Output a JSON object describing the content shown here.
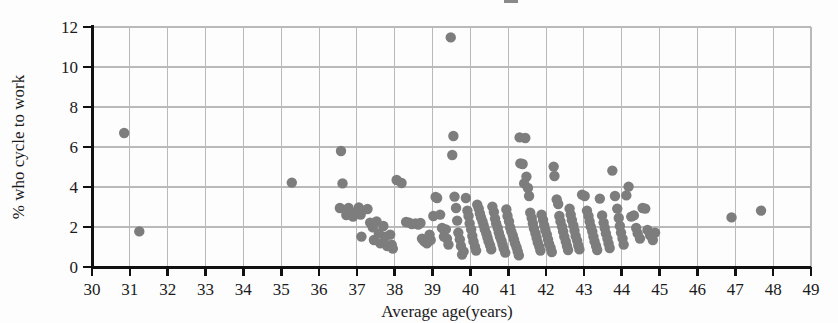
{
  "chart_data": {
    "type": "scatter",
    "title": "",
    "xlabel": "Average age(years)",
    "ylabel": "% who cycle to work",
    "xlim": [
      30,
      49
    ],
    "ylim": [
      0,
      12
    ],
    "xticks": [
      30,
      31,
      32,
      33,
      34,
      35,
      36,
      37,
      38,
      39,
      40,
      41,
      42,
      43,
      44,
      45,
      46,
      47,
      48,
      49
    ],
    "yticks": [
      0,
      2,
      4,
      6,
      8,
      10,
      12
    ],
    "xtick_labels": [
      "30",
      "31",
      "32",
      "33",
      "34",
      "35",
      "36",
      "37",
      "38",
      "39",
      "40",
      "41",
      "42",
      "43",
      "44",
      "45",
      "46",
      "47",
      "48",
      "49"
    ],
    "ytick_labels": [
      "0",
      "2",
      "4",
      "6",
      "8",
      "10",
      "12"
    ],
    "grid": true,
    "grid_x_step": 1,
    "grid_y_step": 2,
    "legend": "none",
    "marker": {
      "shape": "circle",
      "size": 5.2,
      "color": "#7d7d7d"
    },
    "series": [
      {
        "name": "local authorities",
        "points": [
          [
            30.85,
            6.7
          ],
          [
            31.25,
            1.78
          ],
          [
            35.28,
            4.22
          ],
          [
            36.58,
            5.8
          ],
          [
            36.62,
            4.18
          ],
          [
            36.55,
            2.95
          ],
          [
            36.72,
            2.6
          ],
          [
            36.78,
            2.95
          ],
          [
            36.85,
            2.72
          ],
          [
            36.9,
            2.52
          ],
          [
            37.05,
            2.98
          ],
          [
            37.1,
            2.62
          ],
          [
            37.12,
            1.52
          ],
          [
            37.28,
            2.9
          ],
          [
            37.35,
            2.22
          ],
          [
            37.42,
            1.98
          ],
          [
            37.45,
            1.35
          ],
          [
            37.52,
            2.28
          ],
          [
            37.58,
            1.68
          ],
          [
            37.62,
            1.18
          ],
          [
            37.7,
            2.05
          ],
          [
            37.75,
            1.52
          ],
          [
            37.8,
            1.05
          ],
          [
            37.88,
            1.62
          ],
          [
            37.92,
            1.12
          ],
          [
            37.95,
            0.92
          ],
          [
            38.05,
            4.35
          ],
          [
            38.18,
            4.2
          ],
          [
            38.3,
            2.25
          ],
          [
            38.38,
            2.22
          ],
          [
            38.45,
            2.15
          ],
          [
            38.55,
            2.18
          ],
          [
            38.62,
            2.12
          ],
          [
            38.68,
            2.2
          ],
          [
            38.72,
            1.42
          ],
          [
            38.78,
            1.28
          ],
          [
            38.85,
            1.18
          ],
          [
            38.92,
            1.62
          ],
          [
            38.95,
            1.35
          ],
          [
            39.02,
            2.55
          ],
          [
            39.08,
            3.5
          ],
          [
            39.12,
            3.45
          ],
          [
            39.2,
            2.62
          ],
          [
            39.25,
            1.95
          ],
          [
            39.3,
            1.52
          ],
          [
            39.35,
            1.88
          ],
          [
            39.38,
            1.42
          ],
          [
            39.42,
            1.12
          ],
          [
            39.48,
            11.48
          ],
          [
            39.52,
            5.6
          ],
          [
            39.55,
            6.55
          ],
          [
            39.58,
            3.52
          ],
          [
            39.62,
            2.95
          ],
          [
            39.65,
            2.32
          ],
          [
            39.68,
            1.72
          ],
          [
            39.72,
            1.38
          ],
          [
            39.75,
            1.05
          ],
          [
            39.78,
            0.62
          ],
          [
            39.82,
            0.78
          ],
          [
            39.88,
            3.45
          ],
          [
            39.92,
            2.82
          ],
          [
            39.95,
            2.55
          ],
          [
            39.98,
            2.18
          ],
          [
            40.02,
            1.88
          ],
          [
            40.05,
            1.55
          ],
          [
            40.08,
            1.28
          ],
          [
            40.12,
            1.02
          ],
          [
            40.15,
            0.82
          ],
          [
            40.18,
            3.12
          ],
          [
            40.22,
            2.92
          ],
          [
            40.25,
            2.68
          ],
          [
            40.28,
            2.48
          ],
          [
            40.32,
            2.28
          ],
          [
            40.35,
            2.08
          ],
          [
            40.38,
            1.88
          ],
          [
            40.42,
            1.68
          ],
          [
            40.45,
            1.48
          ],
          [
            40.48,
            1.28
          ],
          [
            40.52,
            1.08
          ],
          [
            40.55,
            0.88
          ],
          [
            40.58,
            3.02
          ],
          [
            40.62,
            2.75
          ],
          [
            40.65,
            2.42
          ],
          [
            40.68,
            2.18
          ],
          [
            40.72,
            1.95
          ],
          [
            40.75,
            1.72
          ],
          [
            40.78,
            1.52
          ],
          [
            40.82,
            1.32
          ],
          [
            40.85,
            1.12
          ],
          [
            40.88,
            0.92
          ],
          [
            40.92,
            0.72
          ],
          [
            40.95,
            2.88
          ],
          [
            40.98,
            2.55
          ],
          [
            41.02,
            2.28
          ],
          [
            41.05,
            1.98
          ],
          [
            41.08,
            1.78
          ],
          [
            41.12,
            1.58
          ],
          [
            41.15,
            1.38
          ],
          [
            41.18,
            1.18
          ],
          [
            41.22,
            0.98
          ],
          [
            41.25,
            0.78
          ],
          [
            41.28,
            0.58
          ],
          [
            41.3,
            6.48
          ],
          [
            41.45,
            6.45
          ],
          [
            41.32,
            5.18
          ],
          [
            41.38,
            5.15
          ],
          [
            41.42,
            4.18
          ],
          [
            41.48,
            4.52
          ],
          [
            41.52,
            3.95
          ],
          [
            41.55,
            3.55
          ],
          [
            41.58,
            2.72
          ],
          [
            41.62,
            2.45
          ],
          [
            41.65,
            2.18
          ],
          [
            41.68,
            1.92
          ],
          [
            41.72,
            1.68
          ],
          [
            41.75,
            1.45
          ],
          [
            41.78,
            1.22
          ],
          [
            41.82,
            1.02
          ],
          [
            41.85,
            0.82
          ],
          [
            41.88,
            2.62
          ],
          [
            41.92,
            2.35
          ],
          [
            41.95,
            2.08
          ],
          [
            41.98,
            1.85
          ],
          [
            42.02,
            1.62
          ],
          [
            42.05,
            1.38
          ],
          [
            42.08,
            1.15
          ],
          [
            42.12,
            0.95
          ],
          [
            42.15,
            0.75
          ],
          [
            42.2,
            5.02
          ],
          [
            42.22,
            4.55
          ],
          [
            42.28,
            3.38
          ],
          [
            42.32,
            3.15
          ],
          [
            42.35,
            2.55
          ],
          [
            42.38,
            2.28
          ],
          [
            42.42,
            2.02
          ],
          [
            42.45,
            1.78
          ],
          [
            42.48,
            1.52
          ],
          [
            42.52,
            1.28
          ],
          [
            42.55,
            1.05
          ],
          [
            42.58,
            0.85
          ],
          [
            42.62,
            2.92
          ],
          [
            42.65,
            2.62
          ],
          [
            42.68,
            2.35
          ],
          [
            42.72,
            2.08
          ],
          [
            42.75,
            1.82
          ],
          [
            42.78,
            1.55
          ],
          [
            42.82,
            1.32
          ],
          [
            42.85,
            1.08
          ],
          [
            42.88,
            0.88
          ],
          [
            42.95,
            3.62
          ],
          [
            43.02,
            3.55
          ],
          [
            43.08,
            2.82
          ],
          [
            43.12,
            2.55
          ],
          [
            43.15,
            2.28
          ],
          [
            43.18,
            2.02
          ],
          [
            43.22,
            1.78
          ],
          [
            43.25,
            1.52
          ],
          [
            43.28,
            1.28
          ],
          [
            43.32,
            1.05
          ],
          [
            43.35,
            0.85
          ],
          [
            43.42,
            3.42
          ],
          [
            43.48,
            2.58
          ],
          [
            43.52,
            2.22
          ],
          [
            43.55,
            1.95
          ],
          [
            43.58,
            1.68
          ],
          [
            43.62,
            1.42
          ],
          [
            43.65,
            1.18
          ],
          [
            43.68,
            0.95
          ],
          [
            43.75,
            4.82
          ],
          [
            43.82,
            3.55
          ],
          [
            43.88,
            2.92
          ],
          [
            43.92,
            2.45
          ],
          [
            43.95,
            2.05
          ],
          [
            43.98,
            1.72
          ],
          [
            44.02,
            1.42
          ],
          [
            44.05,
            1.12
          ],
          [
            44.12,
            3.58
          ],
          [
            44.18,
            4.02
          ],
          [
            44.25,
            2.52
          ],
          [
            44.32,
            2.58
          ],
          [
            44.38,
            1.95
          ],
          [
            44.42,
            1.68
          ],
          [
            44.48,
            1.42
          ],
          [
            44.55,
            2.95
          ],
          [
            44.62,
            2.92
          ],
          [
            44.68,
            1.85
          ],
          [
            44.75,
            1.58
          ],
          [
            44.82,
            1.35
          ],
          [
            44.88,
            1.72
          ],
          [
            46.9,
            2.48
          ],
          [
            47.68,
            2.82
          ]
        ]
      }
    ]
  },
  "axes": {
    "x_title": "Average age(years)",
    "y_title": "% who cycle to work"
  }
}
